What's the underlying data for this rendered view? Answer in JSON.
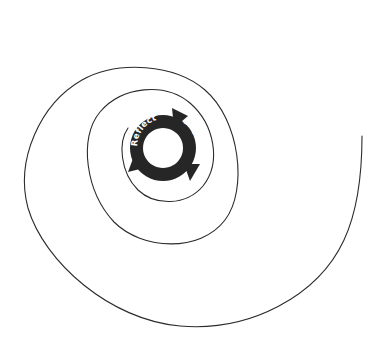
{
  "diagram": {
    "type": "spiral-with-cycle",
    "cycle": {
      "labels": [
        "Engage",
        "Activate",
        "Reflect"
      ],
      "band_color": "#262626",
      "text_color": "#ffffff",
      "direction": "clockwise"
    },
    "spiral": {
      "stroke_color": "#2b2b2b",
      "turns": 3
    }
  }
}
